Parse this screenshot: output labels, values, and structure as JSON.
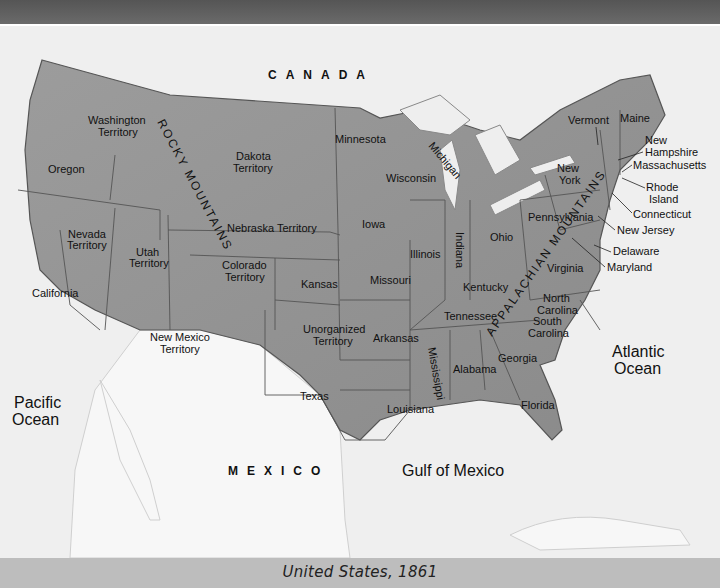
{
  "map": {
    "title": "United States, 1861",
    "countries": {
      "canada": "CANADA",
      "mexico": "MEXICO"
    },
    "oceans": {
      "pacific": [
        "Pacific",
        "Ocean"
      ],
      "atlantic": [
        "Atlantic",
        "Ocean"
      ],
      "gulf": "Gulf of Mexico"
    },
    "features": {
      "rocky_mountains": "ROCKY MOUNTAINS",
      "appalachian_mountains": "APPALACHIAN MOUNTAINS",
      "lake_michigan": "Michigan"
    },
    "regions": {
      "washington": [
        "Washington",
        "Territory"
      ],
      "oregon": "Oregon",
      "california": "California",
      "nevada": [
        "Nevada",
        "Territory"
      ],
      "utah": [
        "Utah",
        "Territory"
      ],
      "dakota": [
        "Dakota",
        "Territory"
      ],
      "nebraska": "Nebraska Territory",
      "colorado": [
        "Colorado",
        "Territory"
      ],
      "kansas": "Kansas",
      "new_mexico": [
        "New Mexico",
        "Territory"
      ],
      "unorganized": [
        "Unorganized",
        "Territory"
      ],
      "texas": "Texas",
      "minnesota": "Minnesota",
      "iowa": "Iowa",
      "missouri": "Missouri",
      "arkansas": "Arkansas",
      "louisiana": "Louisiana",
      "wisconsin": "Wisconsin",
      "illinois": "Illinois",
      "indiana": "Indiana",
      "ohio": "Ohio",
      "kentucky": "Kentucky",
      "tennessee": "Tennessee",
      "mississippi": "Mississippi",
      "alabama": "Alabama",
      "georgia": "Georgia",
      "florida": "Florida",
      "south_carolina": [
        "South",
        "Carolina"
      ],
      "north_carolina": [
        "North",
        "Carolina"
      ],
      "virginia": "Virginia",
      "pennsylvania": "Pennsylvania",
      "new_york": [
        "New",
        "York"
      ],
      "vermont": "Vermont",
      "maine": "Maine",
      "new_hampshire": [
        "New",
        "Hampshire"
      ],
      "massachusetts": "Massachusetts",
      "rhode_island": [
        "Rhode",
        "Island"
      ],
      "connecticut": "Connecticut",
      "new_jersey": "New Jersey",
      "delaware": "Delaware",
      "maryland": "Maryland"
    }
  }
}
